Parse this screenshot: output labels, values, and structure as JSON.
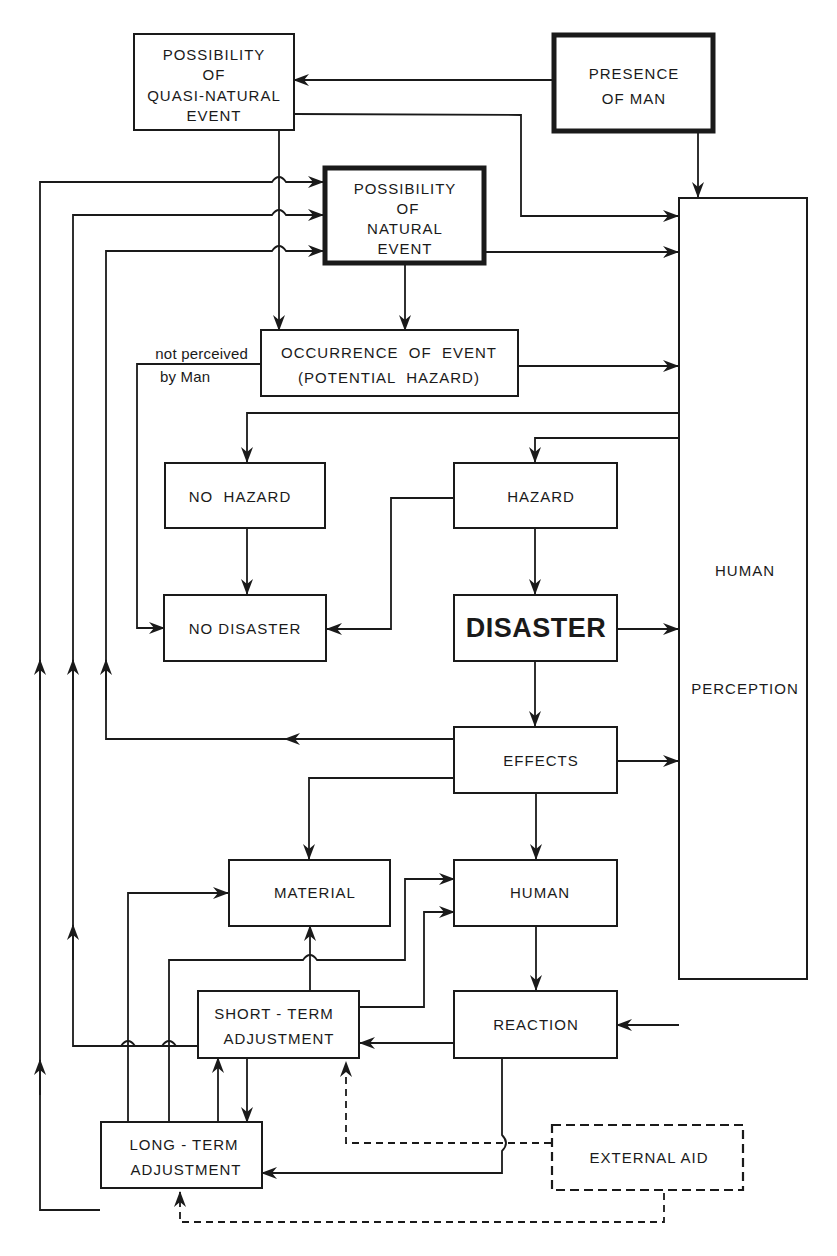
{
  "diagram": {
    "colors": {
      "ink": "#1a1a1a",
      "background": "#ffffff"
    },
    "nodes": {
      "quasi_natural": {
        "lines": [
          "POSSIBILITY",
          "OF",
          "QUASI-NATURAL",
          "EVENT"
        ]
      },
      "presence_of_man": {
        "lines": [
          "PRESENCE",
          "OF MAN"
        ]
      },
      "natural_event": {
        "lines": [
          "POSSIBILITY",
          "OF",
          "NATURAL",
          "EVENT"
        ]
      },
      "occurrence": {
        "lines": [
          "OCCURRENCE  OF  EVENT",
          "(POTENTIAL  HAZARD)"
        ]
      },
      "no_hazard": {
        "label": "NO  HAZARD"
      },
      "hazard": {
        "label": "HAZARD"
      },
      "no_disaster": {
        "label": "NO DISASTER"
      },
      "disaster": {
        "label": "DISASTER"
      },
      "effects": {
        "label": "EFFECTS"
      },
      "material": {
        "label": "MATERIAL"
      },
      "human": {
        "label": "HUMAN"
      },
      "short_term": {
        "lines": [
          "SHORT - TERM",
          "ADJUSTMENT"
        ]
      },
      "reaction": {
        "label": "REACTION"
      },
      "long_term": {
        "lines": [
          "LONG - TERM",
          "ADJUSTMENT"
        ]
      },
      "external_aid": {
        "label": "EXTERNAL AID"
      },
      "human_perception": {
        "lines": [
          "HUMAN",
          "PERCEPTION"
        ]
      }
    },
    "annotations": {
      "not_perceived": [
        "not perceived",
        "by Man"
      ]
    }
  }
}
